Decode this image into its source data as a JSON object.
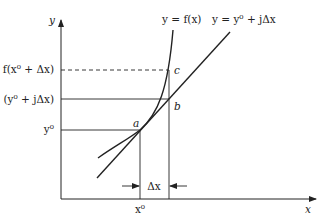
{
  "diagram": {
    "type": "newton-step-geometry",
    "axes": {
      "x_label": "x",
      "y_label": "y"
    },
    "curves": {
      "function_label": "y = f(x)",
      "tangent_label": "y = y⁰ + jΔx"
    },
    "points": {
      "a": "a",
      "b": "b",
      "c": "c"
    },
    "y_ticks": {
      "f_shift": "f(x⁰ + Δx)",
      "linear": "(y⁰ + jΔx)",
      "y0": "y⁰"
    },
    "x_ticks": {
      "x0": "x⁰"
    },
    "delta_label": "Δx",
    "colors": {
      "line": "#222222",
      "background": "#ffffff"
    }
  }
}
